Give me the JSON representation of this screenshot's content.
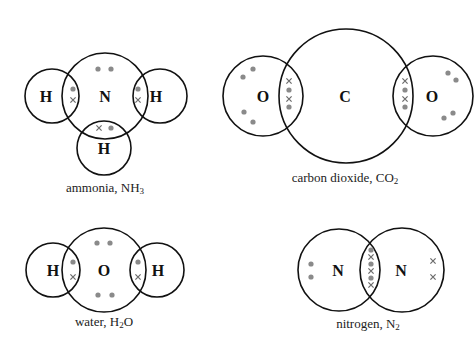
{
  "legend": {
    "dot": "electron from one atom (grey dot)",
    "cross": "electron from other atom (cross)"
  },
  "colors": {
    "outline": "#111111",
    "dot": "#8a8a8a",
    "cross": "#6a6a6a",
    "background": "#ffffff"
  },
  "molecules": [
    {
      "id": "ammonia",
      "name": "ammonia",
      "formula_main": "NH",
      "formula_sub": "3",
      "caption_prefix": "ammonia, ",
      "atoms": [
        {
          "symbol": "H",
          "cx": 52,
          "cy": 96,
          "r": 27
        },
        {
          "symbol": "N",
          "cx": 105,
          "cy": 96,
          "r": 43
        },
        {
          "symbol": "H",
          "cx": 160,
          "cy": 96,
          "r": 27
        },
        {
          "symbol": "H",
          "cx": 104,
          "cy": 148,
          "r": 27
        }
      ],
      "electrons": {
        "dots": [
          [
            98,
            69
          ],
          [
            111,
            69
          ],
          [
            73,
            89
          ],
          [
            138,
            89
          ],
          [
            111,
            128
          ]
        ],
        "crosses": [
          [
            73,
            100
          ],
          [
            138,
            100
          ],
          [
            99,
            128
          ]
        ]
      }
    },
    {
      "id": "carbon-dioxide",
      "name": "carbon dioxide",
      "formula_main": "CO",
      "formula_sub": "2",
      "caption_prefix": "carbon dioxide, ",
      "atoms": [
        {
          "symbol": "O",
          "cx": 263,
          "cy": 96,
          "r": 40
        },
        {
          "symbol": "C",
          "cx": 346,
          "cy": 96,
          "r": 67
        },
        {
          "symbol": "O",
          "cx": 433,
          "cy": 96,
          "r": 40
        }
      ],
      "electrons": {
        "dots": [
          [
            243,
            77
          ],
          [
            253,
            69
          ],
          [
            244,
            112
          ],
          [
            253,
            122
          ],
          [
            289,
            90
          ],
          [
            289,
            107
          ],
          [
            405,
            90
          ],
          [
            405,
            107
          ],
          [
            448,
            73
          ],
          [
            456,
            80
          ],
          [
            453,
            113
          ],
          [
            444,
            118
          ]
        ],
        "crosses": [
          [
            289,
            81
          ],
          [
            289,
            99
          ],
          [
            405,
            81
          ],
          [
            405,
            99
          ]
        ]
      }
    },
    {
      "id": "water",
      "name": "water",
      "formula_main": "H",
      "formula_sub": "2",
      "formula_tail": "O",
      "caption_prefix": "water, ",
      "atoms": [
        {
          "symbol": "H",
          "cx": 53,
          "cy": 270,
          "r": 27
        },
        {
          "symbol": "O",
          "cx": 104,
          "cy": 270,
          "r": 42
        },
        {
          "symbol": "H",
          "cx": 157,
          "cy": 270,
          "r": 27
        }
      ],
      "electrons": {
        "dots": [
          [
            97,
            243
          ],
          [
            110,
            243
          ],
          [
            98,
            295
          ],
          [
            112,
            295
          ],
          [
            73,
            262
          ],
          [
            138,
            262
          ]
        ],
        "crosses": [
          [
            73,
            277
          ],
          [
            138,
            277
          ]
        ]
      }
    },
    {
      "id": "nitrogen",
      "name": "nitrogen",
      "formula_main": "N",
      "formula_sub": "2",
      "caption_prefix": "nitrogen, ",
      "atoms": [
        {
          "symbol": "N",
          "cx": 339,
          "cy": 270,
          "r": 41
        },
        {
          "symbol": "N",
          "cx": 402,
          "cy": 270,
          "r": 42
        }
      ],
      "electrons": {
        "dots": [
          [
            311,
            264
          ],
          [
            311,
            277
          ],
          [
            371,
            250
          ],
          [
            371,
            264
          ],
          [
            371,
            278
          ]
        ],
        "crosses": [
          [
            371,
            257
          ],
          [
            371,
            271
          ],
          [
            371,
            285
          ],
          [
            433,
            261
          ],
          [
            433,
            277
          ]
        ]
      }
    }
  ]
}
